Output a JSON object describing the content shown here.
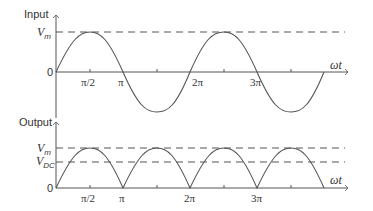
{
  "input_panel": {
    "title": "Input",
    "y_labels": {
      "peak": "V",
      "peak_sub": "m",
      "zero": "0"
    },
    "x_label": "ωt",
    "ticks": [
      "π/2",
      "π",
      "2π",
      "3π"
    ]
  },
  "output_panel": {
    "title": "Output",
    "y_labels": {
      "peak": "V",
      "peak_sub": "m",
      "dc": "V",
      "dc_sub": "DC",
      "zero": "0"
    },
    "x_label": "ωt",
    "ticks": [
      "π/2",
      "π",
      "2π",
      "3π"
    ]
  },
  "colors": {
    "stroke": "#555555",
    "text": "#333333"
  }
}
